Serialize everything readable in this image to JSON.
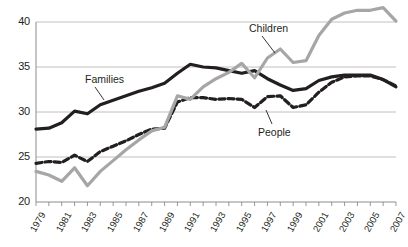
{
  "chart_data": {
    "type": "line",
    "title": "",
    "subtitle": "",
    "xlabel": "",
    "ylabel": "",
    "xlim": [
      1979,
      2007
    ],
    "ylim": [
      20,
      40
    ],
    "yticks": [
      20,
      25,
      30,
      35,
      40
    ],
    "ytick_labels": [
      "20",
      "25",
      "30",
      "35",
      "40"
    ],
    "grid": "horizontal",
    "legend_position": "inline-annotations",
    "x": [
      1979,
      1980,
      1981,
      1982,
      1983,
      1984,
      1985,
      1986,
      1987,
      1988,
      1989,
      1990,
      1991,
      1992,
      1993,
      1994,
      1995,
      1996,
      1997,
      1998,
      1999,
      2000,
      2001,
      2002,
      2003,
      2004,
      2005,
      2006,
      2007
    ],
    "xtick_labels": [
      "1979",
      "",
      "1981",
      "",
      "1983",
      "",
      "1985",
      "",
      "1987",
      "",
      "1989",
      "",
      "1991",
      "",
      "1993",
      "",
      "1995",
      "",
      "1997",
      "",
      "1999",
      "",
      "2001",
      "",
      "2003",
      "",
      "2005",
      "",
      "2007"
    ],
    "series": [
      {
        "name": "Families",
        "color": "#231f20",
        "style": "solid",
        "values": [
          28.1,
          28.2,
          28.8,
          30.1,
          29.8,
          30.8,
          31.3,
          31.8,
          32.3,
          32.7,
          33.2,
          34.3,
          35.3,
          35.0,
          34.9,
          34.6,
          34.3,
          34.6,
          33.7,
          33.0,
          32.4,
          32.6,
          33.5,
          33.9,
          34.1,
          34.1,
          34.1,
          33.6,
          32.8
        ]
      },
      {
        "name": "People",
        "color": "#231f20",
        "style": "dashed",
        "values": [
          24.3,
          24.5,
          24.4,
          25.2,
          24.5,
          25.6,
          26.2,
          26.8,
          27.5,
          28.1,
          28.2,
          31.1,
          31.6,
          31.6,
          31.4,
          31.5,
          31.4,
          30.5,
          31.7,
          31.8,
          30.5,
          30.8,
          32.2,
          33.3,
          33.9,
          34.0,
          34.0,
          33.6,
          32.9
        ]
      },
      {
        "name": "Children",
        "color": "#a6a6a6",
        "style": "solid",
        "values": [
          23.4,
          23.0,
          22.3,
          23.8,
          21.8,
          23.4,
          24.6,
          25.8,
          26.9,
          27.9,
          28.3,
          31.8,
          31.4,
          32.8,
          33.7,
          34.4,
          35.4,
          33.8,
          36.0,
          37.0,
          35.5,
          35.7,
          38.5,
          40.3,
          41.0,
          41.3,
          41.3,
          41.6,
          40.1
        ]
      }
    ],
    "annotations": [
      {
        "text": "Families",
        "series": "Families"
      },
      {
        "text": "People",
        "series": "People"
      },
      {
        "text": "Children",
        "series": "Children"
      }
    ]
  },
  "axis": {
    "y_labels": [
      "40",
      "35",
      "30",
      "25",
      "20"
    ],
    "x_labels": [
      "1979",
      "1981",
      "1983",
      "1985",
      "1987",
      "1989",
      "1991",
      "1993",
      "1995",
      "1997",
      "1999",
      "2001",
      "2003",
      "2005",
      "2007"
    ]
  },
  "colors": {
    "families": "#231f20",
    "people": "#231f20",
    "children": "#a6a6a6",
    "grid": "#b9b9b9",
    "axis": "#8c8c8c",
    "text": "#231f20",
    "background": "#ffffff"
  },
  "labels": {
    "families": "Families",
    "people": "People",
    "children": "Children"
  }
}
